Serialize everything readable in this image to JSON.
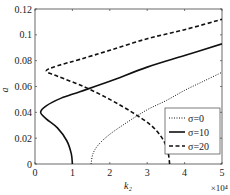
{
  "chart_data": {
    "type": "line",
    "title": "",
    "xlabel": "k₂",
    "ylabel": "a",
    "x_scale_note": "×10⁴",
    "xlim": [
      0,
      5
    ],
    "ylim": [
      0,
      0.12
    ],
    "xticks": [
      "0",
      "1",
      "2",
      "3",
      "4",
      "5"
    ],
    "yticks": [
      "0",
      "0.02",
      "0.04",
      "0.06",
      "0.08",
      "0.1",
      "0.12"
    ],
    "grid": false,
    "legend_position": "lower right",
    "series": [
      {
        "name": "σ=0",
        "style": "dotted",
        "points": [
          [
            1.5,
            0.0
          ],
          [
            1.55,
            0.008
          ],
          [
            1.7,
            0.015
          ],
          [
            2.0,
            0.023
          ],
          [
            2.5,
            0.033
          ],
          [
            3.0,
            0.042
          ],
          [
            3.5,
            0.049
          ],
          [
            4.0,
            0.057
          ],
          [
            4.5,
            0.064
          ],
          [
            5.0,
            0.071
          ]
        ]
      },
      {
        "name": "σ=10",
        "style": "solid",
        "points": [
          [
            1.0,
            0.0
          ],
          [
            0.97,
            0.008
          ],
          [
            0.85,
            0.018
          ],
          [
            0.6,
            0.028
          ],
          [
            0.3,
            0.035
          ],
          [
            0.15,
            0.04
          ],
          [
            0.3,
            0.045
          ],
          [
            0.7,
            0.051
          ],
          [
            1.2,
            0.056
          ],
          [
            2.0,
            0.064
          ],
          [
            3.0,
            0.075
          ],
          [
            4.0,
            0.084
          ],
          [
            5.0,
            0.093
          ]
        ]
      },
      {
        "name": "σ=20",
        "style": "dashed",
        "points": [
          [
            3.6,
            0.0
          ],
          [
            3.55,
            0.01
          ],
          [
            3.4,
            0.02
          ],
          [
            3.1,
            0.03
          ],
          [
            2.6,
            0.04
          ],
          [
            2.0,
            0.05
          ],
          [
            1.3,
            0.06
          ],
          [
            0.6,
            0.068
          ],
          [
            0.3,
            0.072
          ],
          [
            0.6,
            0.076
          ],
          [
            1.2,
            0.081
          ],
          [
            2.0,
            0.088
          ],
          [
            3.0,
            0.097
          ],
          [
            4.0,
            0.104
          ],
          [
            5.0,
            0.112
          ]
        ]
      }
    ]
  }
}
